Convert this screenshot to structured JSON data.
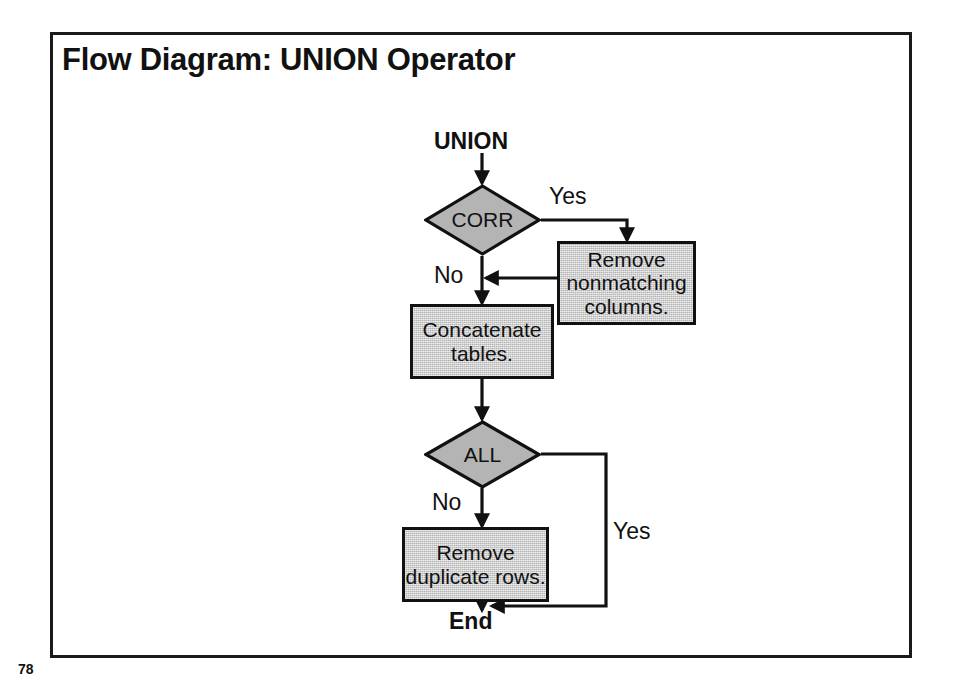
{
  "slide": {
    "title": "Flow Diagram: UNION Operator",
    "page_number": "78",
    "border_color": "#1a1a1a",
    "background_color": "#ffffff"
  },
  "diagram": {
    "type": "flowchart",
    "shape_fill": "#b4b4b4",
    "shape_stroke": "#111111",
    "start_label": "UNION",
    "end_label": "End",
    "decisions": [
      {
        "id": "corr",
        "label": "CORR",
        "yes_label": "Yes",
        "no_label": "No"
      },
      {
        "id": "all",
        "label": "ALL",
        "yes_label": "Yes",
        "no_label": "No"
      }
    ],
    "processes": [
      {
        "id": "remove-nonmatching",
        "label": "Remove\nnonmatching\ncolumns."
      },
      {
        "id": "concatenate",
        "label": "Concatenate\ntables."
      },
      {
        "id": "remove-duplicates",
        "label": "Remove\nduplicate rows."
      }
    ],
    "edges": [
      {
        "from": "start",
        "to": "corr",
        "label": ""
      },
      {
        "from": "corr",
        "to": "remove-nonmatching",
        "label": "Yes"
      },
      {
        "from": "remove-nonmatching",
        "to": "concatenate",
        "label": ""
      },
      {
        "from": "corr",
        "to": "concatenate",
        "label": "No"
      },
      {
        "from": "concatenate",
        "to": "all",
        "label": ""
      },
      {
        "from": "all",
        "to": "remove-duplicates",
        "label": "No"
      },
      {
        "from": "all",
        "to": "end",
        "label": "Yes"
      },
      {
        "from": "remove-duplicates",
        "to": "end",
        "label": ""
      }
    ]
  }
}
